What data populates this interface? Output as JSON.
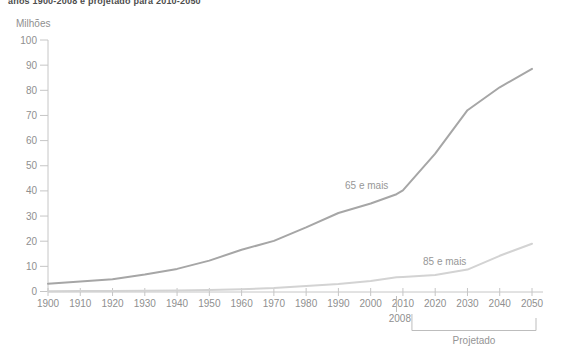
{
  "chart_data": {
    "type": "line",
    "title": "anos 1900-2008 e projetado para 2010-2050",
    "ylabel": "Milhões",
    "x": [
      1900,
      1910,
      1920,
      1930,
      1940,
      1950,
      1960,
      1970,
      1980,
      1990,
      2000,
      2008,
      2010,
      2020,
      2030,
      2040,
      2050
    ],
    "series": [
      {
        "name": "65 e mais",
        "color": "#a6a6a6",
        "values": [
          3.1,
          4.0,
          4.9,
          6.7,
          9.0,
          12.3,
          16.6,
          20.1,
          25.5,
          31.2,
          35.0,
          38.7,
          40.2,
          54.8,
          72.1,
          81.2,
          88.5
        ]
      },
      {
        "name": "85 e mais",
        "color": "#d3d3d3",
        "values": [
          0.1,
          0.2,
          0.2,
          0.3,
          0.4,
          0.6,
          0.9,
          1.4,
          2.2,
          3.0,
          4.2,
          5.7,
          5.8,
          6.6,
          8.7,
          14.2,
          19.0
        ]
      }
    ],
    "x_ticks": [
      1900,
      1910,
      1920,
      1930,
      1940,
      1950,
      1960,
      1970,
      1980,
      1990,
      2000,
      2010,
      2020,
      2030,
      2040,
      2050
    ],
    "y_ticks": [
      0,
      10,
      20,
      30,
      40,
      50,
      60,
      70,
      80,
      90,
      100
    ],
    "ylim": [
      0,
      100
    ],
    "xlim": [
      1900,
      2050
    ],
    "grid": false,
    "legend_position": "inline-labels",
    "annotations": {
      "divider_year": 2008,
      "divider_label": "2008",
      "projected_label": "Projetado",
      "projected_range": [
        2010,
        2050
      ]
    },
    "colors": {
      "axis": "#c6c6c6",
      "tick_label": "#8f8f8f",
      "bracket": "#bdbdbd",
      "title_text": "#4d4d4d"
    }
  }
}
